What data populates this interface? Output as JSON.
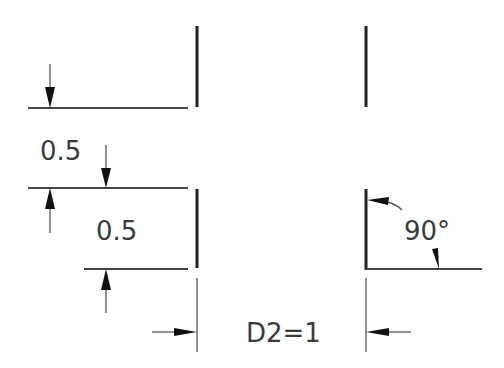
{
  "drawing": {
    "type": "CAD dimensioning diagram",
    "labels": {
      "vertical_dim_upper": "0.5",
      "vertical_dim_lower": "0.5",
      "angle": "90°",
      "horizontal_dim": "D2=1"
    },
    "colors": {
      "background": "#ffffff",
      "line": "#222222",
      "text": "#3a3a3a"
    }
  }
}
